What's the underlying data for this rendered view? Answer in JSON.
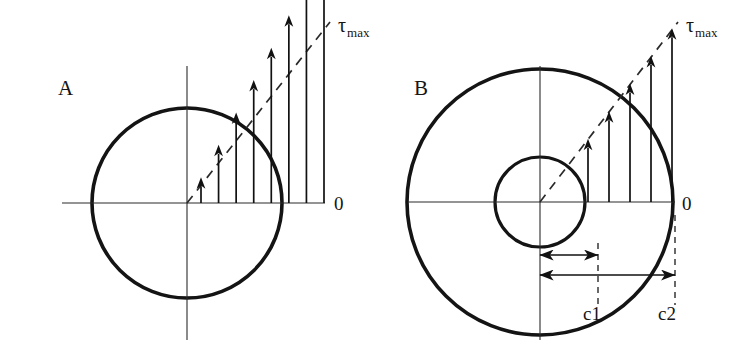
{
  "figure": {
    "background_color": "#ffffff",
    "line_color": "#141414",
    "width": 754,
    "height": 358
  },
  "panels": [
    {
      "id": "A",
      "label": "A",
      "label_x": 58,
      "label_y": 95,
      "type": "solid-shaft",
      "center_x": 187,
      "center_y": 203,
      "outer_radius": 95,
      "inner_radius": 0,
      "zero_label": "0",
      "zero_x": 334,
      "zero_y": 210,
      "tau_symbol": "τ",
      "tau_subscript": "max",
      "tau_x": 338,
      "tau_y": 32,
      "axis_h_x1": 62,
      "axis_h_x2": 325,
      "axis_v_y1": 66,
      "axis_v_y2": 340,
      "arrow_count": 8,
      "arrow_first_x": 201,
      "arrow_last_x": 324,
      "arrow_max_height": 175,
      "envelope_x1": 187,
      "envelope_y1": 203,
      "envelope_x2": 330,
      "envelope_y2": 22,
      "dimensions": []
    },
    {
      "id": "B",
      "label": "B",
      "label_x": 414,
      "label_y": 95,
      "type": "hollow-shaft",
      "center_x": 540,
      "center_y": 202,
      "outer_radius": 133,
      "inner_radius": 45,
      "zero_label": "0",
      "zero_x": 682,
      "zero_y": 210,
      "tau_symbol": "τ",
      "tau_subscript": "max",
      "tau_x": 686,
      "tau_y": 32,
      "axis_h_x1": 408,
      "axis_h_x2": 675,
      "axis_v_y1": 66,
      "axis_v_y2": 340,
      "arrow_count": 5,
      "arrow_first_x": 588,
      "arrow_last_x": 672,
      "arrow_max_height": 175,
      "envelope_x1": 540,
      "envelope_y1": 202,
      "envelope_x2": 678,
      "envelope_y2": 22,
      "dimensions": [
        {
          "name": "c1",
          "label": "c1",
          "label_x": 592,
          "label_y": 320,
          "arrow_y": 255,
          "arrow_x1": 540,
          "arrow_x2": 598,
          "leader_x": 598,
          "leader_y1": 243,
          "leader_y2": 305
        },
        {
          "name": "c2",
          "label": "c2",
          "label_x": 667,
          "label_y": 320,
          "arrow_y": 275,
          "arrow_x1": 540,
          "arrow_x2": 675,
          "leader_x": 675,
          "leader_y1": 215,
          "leader_y2": 305
        }
      ]
    }
  ],
  "chart_data": {
    "type": "line",
    "xlabel": "radial position",
    "ylabel": "shear stress τ",
    "annotations": [
      "τmax",
      "0",
      "c1",
      "c2",
      "A",
      "B"
    ],
    "series": [
      {
        "name": "A - solid shaft shear stress (linear from center)",
        "radius_fraction": [
          0.15,
          0.28,
          0.41,
          0.54,
          0.67,
          0.79,
          0.9,
          1.0
        ],
        "stress_fraction": [
          0.15,
          0.28,
          0.41,
          0.54,
          0.67,
          0.79,
          0.9,
          1.0
        ]
      },
      {
        "name": "B - hollow shaft shear stress (linear from inner radius c1 to outer radius c2)",
        "radius_fraction": [
          0.34,
          0.5,
          0.66,
          0.83,
          1.0
        ],
        "stress_fraction": [
          0.34,
          0.5,
          0.66,
          0.83,
          1.0
        ]
      }
    ]
  }
}
